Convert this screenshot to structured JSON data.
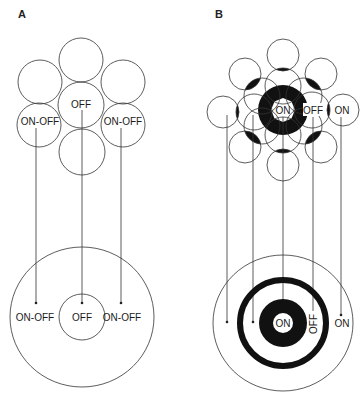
{
  "panels": [
    {
      "id": "A",
      "label": "A",
      "top_cluster": {
        "labels": {
          "center": "OFF",
          "left": "ON-OFF",
          "right": "ON-OFF"
        }
      },
      "bottom_field": {
        "labels": {
          "left": "ON-OFF",
          "center": "OFF",
          "right": "ON-OFF"
        }
      }
    },
    {
      "id": "B",
      "label": "B",
      "top_cluster": {
        "labels": {
          "center": "ON",
          "inner_right": "OFF",
          "outer_right": "ON"
        }
      },
      "bottom_field": {
        "labels": {
          "center": "ON",
          "ring": "OFF",
          "surround": "ON"
        }
      }
    }
  ],
  "colors": {
    "stroke": "#333333",
    "fill_dark": "#111111",
    "background": "#ffffff"
  }
}
